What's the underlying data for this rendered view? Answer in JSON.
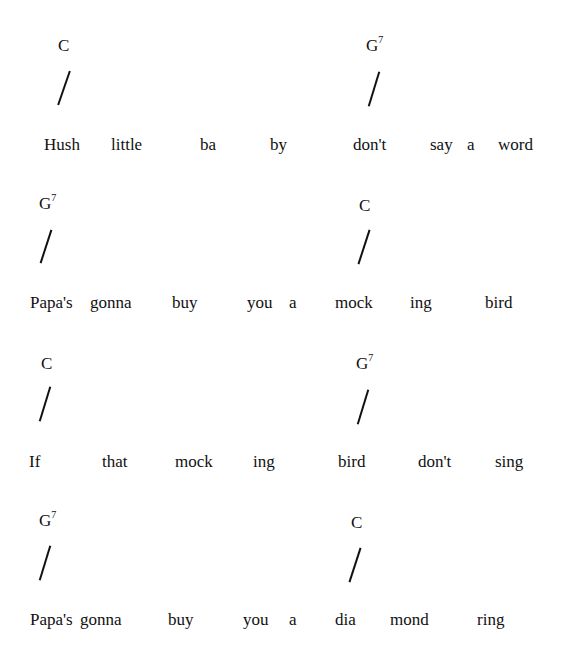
{
  "song": {
    "lines": [
      {
        "chords": [
          {
            "root": "C",
            "ext": ""
          },
          {
            "root": "G",
            "ext": "7"
          }
        ],
        "words": [
          "Hush",
          "little",
          "ba",
          "by",
          "don't",
          "say",
          "a",
          "word"
        ]
      },
      {
        "chords": [
          {
            "root": "G",
            "ext": "7"
          },
          {
            "root": "C",
            "ext": ""
          }
        ],
        "words": [
          "Papa's",
          "gonna",
          "buy",
          "you",
          "a",
          "mock",
          "ing",
          "bird"
        ]
      },
      {
        "chords": [
          {
            "root": "C",
            "ext": ""
          },
          {
            "root": "G",
            "ext": "7"
          }
        ],
        "words": [
          "If",
          "that",
          "mock",
          "ing",
          "bird",
          "don't",
          "sing"
        ]
      },
      {
        "chords": [
          {
            "root": "G",
            "ext": "7"
          },
          {
            "root": "C",
            "ext": ""
          }
        ],
        "words": [
          "Papa's",
          "gonna",
          "buy",
          "you",
          "a",
          "dia",
          "mond",
          "ring"
        ]
      }
    ],
    "beat_mark": "/"
  }
}
